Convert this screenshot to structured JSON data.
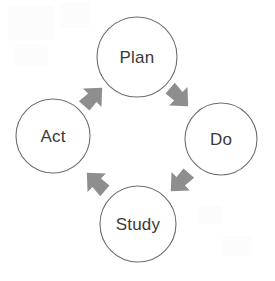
{
  "diagram": {
    "type": "cycle",
    "direction": "clockwise",
    "background_color": "#ffffff",
    "node_fill_color": "#ffffff",
    "node_stroke_color": "#6e6e6e",
    "label_color": "#3a3a3a",
    "arrow_color": "#8e8e8e",
    "nodes": [
      {
        "id": "plan",
        "label": "Plan",
        "position": "top",
        "cx": 137,
        "cy": 57,
        "r": 40
      },
      {
        "id": "do",
        "label": "Do",
        "position": "right",
        "cx": 221,
        "cy": 139,
        "r": 36
      },
      {
        "id": "study",
        "label": "Study",
        "position": "bottom",
        "cx": 138,
        "cy": 224,
        "r": 38
      },
      {
        "id": "act",
        "label": "Act",
        "position": "left",
        "cx": 53,
        "cy": 136,
        "r": 37
      }
    ],
    "arrows": [
      {
        "id": "act-to-plan",
        "from": "act",
        "to": "plan",
        "direction": "northeast",
        "cx": 93,
        "cy": 97,
        "rotation": -45
      },
      {
        "id": "plan-to-do",
        "from": "plan",
        "to": "do",
        "direction": "southeast",
        "cx": 179,
        "cy": 97,
        "rotation": 45
      },
      {
        "id": "do-to-study",
        "from": "do",
        "to": "study",
        "direction": "southwest",
        "cx": 180,
        "cy": 182,
        "rotation": 135
      },
      {
        "id": "study-to-act",
        "from": "study",
        "to": "act",
        "direction": "northwest",
        "cx": 96,
        "cy": 182,
        "rotation": -135
      }
    ]
  }
}
